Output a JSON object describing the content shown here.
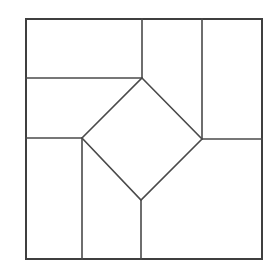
{
  "figure": {
    "type": "geometric-line-diagram",
    "canvas": {
      "width": 280,
      "height": 277,
      "background": "#ffffff"
    },
    "style": {
      "stroke_color": "#4a4a4a",
      "outer_stroke_color": "#3f3f3f",
      "fill_color": "#ffffff",
      "stroke_width": 1.6,
      "outer_stroke_width": 2.0
    },
    "bounds": {
      "left": 26,
      "top": 19,
      "right": 262,
      "bottom": 259
    },
    "vertices": {
      "outer_top_left": [
        26,
        19
      ],
      "outer_top_right": [
        262,
        19
      ],
      "outer_bottom_right": [
        262,
        259
      ],
      "outer_bottom_left": [
        26,
        259
      ],
      "diamond_top": [
        142,
        78
      ],
      "diamond_right": [
        202,
        139
      ],
      "diamond_bottom": [
        141,
        200
      ],
      "diamond_left": [
        82,
        138
      ],
      "top_edge_a": [
        142,
        19
      ],
      "top_edge_b": [
        202,
        19
      ],
      "left_edge_a": [
        26,
        78
      ],
      "left_edge_b": [
        26,
        138
      ],
      "right_edge_a": [
        262,
        139
      ],
      "bottom_edge_a": [
        82,
        259
      ],
      "bottom_edge_b": [
        141,
        259
      ]
    },
    "shapes": [
      {
        "name": "outer-square",
        "points": "26,19 262,19 262,259 26,259"
      },
      {
        "name": "center-diamond",
        "points": "142,78 202,139 141,200 82,138"
      },
      {
        "name": "region-top-left",
        "points": "26,19 142,19 142,78 26,78"
      },
      {
        "name": "region-top-middle",
        "points": "142,19 202,19 202,139 142,78"
      },
      {
        "name": "region-top-right",
        "points": "202,19 262,19 262,139 202,139"
      },
      {
        "name": "region-left-middle",
        "points": "26,78 142,78 82,138 26,138"
      },
      {
        "name": "region-right-middle",
        "points": "202,139 262,139 262,259 141,259 141,200"
      },
      {
        "name": "region-bottom-left",
        "points": "26,138 82,138 82,259 26,259"
      },
      {
        "name": "region-bottom-middle",
        "points": "82,138 141,200 141,259 82,259"
      }
    ],
    "segments": [
      {
        "name": "outer-border",
        "kind": "outer",
        "d": "M26,19 L262,19 L262,259 L26,259 Z"
      },
      {
        "name": "diamond-border",
        "kind": "inner",
        "d": "M142,78 L202,139 L141,200 L82,138 Z"
      },
      {
        "name": "top-divider-left",
        "kind": "inner",
        "d": "M142,19 L142,78"
      },
      {
        "name": "top-divider-right",
        "kind": "inner",
        "d": "M202,19 L202,139"
      },
      {
        "name": "left-divider-upper",
        "kind": "inner",
        "d": "M26,78 L142,78"
      },
      {
        "name": "left-divider-lower",
        "kind": "inner",
        "d": "M26,138 L82,138"
      },
      {
        "name": "right-divider",
        "kind": "inner",
        "d": "M202,139 L262,139"
      },
      {
        "name": "bottom-divider-left",
        "kind": "inner",
        "d": "M82,138 L82,259"
      },
      {
        "name": "bottom-divider-right",
        "kind": "inner",
        "d": "M141,200 L141,259"
      }
    ]
  }
}
